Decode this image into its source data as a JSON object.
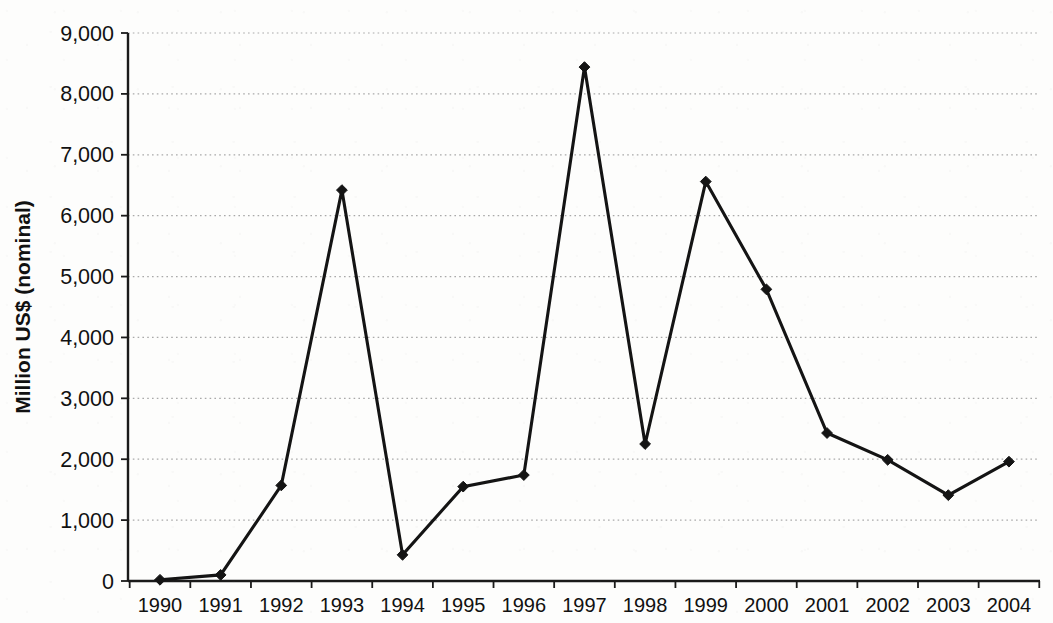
{
  "chart_data": {
    "type": "line",
    "title": "",
    "subtitle": "",
    "xlabel": "",
    "ylabel": "Million US$ (nominal)",
    "categories": [
      "1990",
      "1991",
      "1992",
      "1993",
      "1994",
      "1995",
      "1996",
      "1997",
      "1998",
      "1999",
      "2000",
      "2001",
      "2002",
      "2003",
      "2004"
    ],
    "values": [
      20,
      100,
      1570,
      6420,
      430,
      1550,
      1740,
      8440,
      2250,
      6560,
      4790,
      2430,
      1990,
      1410,
      1960
    ],
    "series": [
      {
        "name": "Million US$ (nominal)",
        "values": [
          20,
          100,
          1570,
          6420,
          430,
          1550,
          1740,
          8440,
          2250,
          6560,
          4790,
          2430,
          1990,
          1410,
          1960
        ]
      }
    ],
    "ylim": [
      0,
      9000
    ],
    "y_ticks": [
      0,
      1000,
      2000,
      3000,
      4000,
      5000,
      6000,
      7000,
      8000,
      9000
    ],
    "y_tick_labels": [
      "0",
      "1,000",
      "2,000",
      "3,000",
      "4,000",
      "5,000",
      "6,000",
      "7,000",
      "8,000",
      "9,000"
    ],
    "x_tick_labels": [
      "1990",
      "1991",
      "1992",
      "1993",
      "1994",
      "1995",
      "1996",
      "1997",
      "1998",
      "1999",
      "2000",
      "2001",
      "2002",
      "2003",
      "2004"
    ],
    "grid": "horizontal-dotted",
    "legend": "none",
    "marker": "diamond",
    "line_color": "#141414",
    "marker_color": "#141414",
    "grid_color": "#a9a9a9",
    "axis_color": "#1a1a1a",
    "background_color": "#fdfdfc"
  },
  "layout": {
    "plot_left": 128,
    "plot_right": 1040,
    "plot_top": 33,
    "plot_bottom": 581,
    "first_category_x": 160,
    "category_step": 60.64
  }
}
